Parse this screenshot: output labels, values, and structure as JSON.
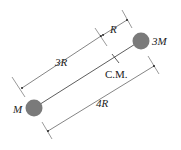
{
  "diagram": {
    "masses": [
      {
        "label": "M",
        "position": "lower-left"
      },
      {
        "label": "3M",
        "position": "upper-right"
      }
    ],
    "center_of_mass_label": "C.M.",
    "dimensions": [
      {
        "label": "3R",
        "from": "M",
        "to": "C.M."
      },
      {
        "label": "R",
        "from": "C.M.",
        "to": "3M"
      },
      {
        "label": "4R",
        "from": "M",
        "to": "3M"
      }
    ],
    "colors": {
      "mass_fill": "#7a7a7a",
      "line": "#333333",
      "background": "#ffffff"
    }
  }
}
